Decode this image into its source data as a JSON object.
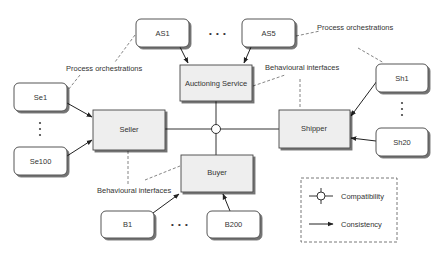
{
  "diagram": {
    "core_components": {
      "auctioning_service": "Auctioning Service",
      "seller": "Seller",
      "shipper": "Shipper",
      "buyer": "Buyer"
    },
    "instances": {
      "as_first": "AS1",
      "as_last": "AS5",
      "seller_first": "Se1",
      "seller_last": "Se100",
      "shipper_first": "Sh1",
      "shipper_last": "Sh20",
      "buyer_first": "B1",
      "buyer_last": "B200"
    },
    "annotations": {
      "process_orchestrations_left": "Process orchestrations",
      "process_orchestrations_right": "Process orchestrations",
      "behavioural_interfaces_top": "Behavioural interfaces",
      "behavioural_interfaces_bottom": "Behavioural interfaces"
    },
    "ellipsis": {
      "horizontal": "• • •"
    },
    "legend": {
      "compatibility": "Compatibility",
      "consistency": "Consistency"
    },
    "colors": {
      "box_fill": "#eeeeee",
      "box_stroke": "#444444",
      "shadow": "#9a9a9a",
      "rounded_fill": "#ffffff",
      "line": "#333333",
      "dashed": "#555555"
    }
  }
}
